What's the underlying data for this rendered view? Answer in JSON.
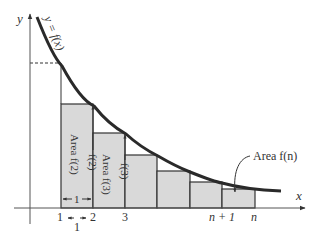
{
  "figure": {
    "curve_label": "y = f(x)",
    "axes": {
      "x_label": "x",
      "y_label": "y"
    },
    "x_ticks": [
      "1",
      "2",
      "3",
      "n + 1",
      "n"
    ],
    "width_marker_inner": "1",
    "width_marker_outer": "1",
    "rect_labels": [
      "Area f(2)",
      "Area f(3)"
    ],
    "height_labels": [
      "f(2)",
      "f(3)"
    ],
    "callout": "Area f(n)",
    "colors": {
      "rect_fill": "#d9d9d9",
      "curve": "#2a2a2a",
      "lines": "#333333"
    }
  }
}
